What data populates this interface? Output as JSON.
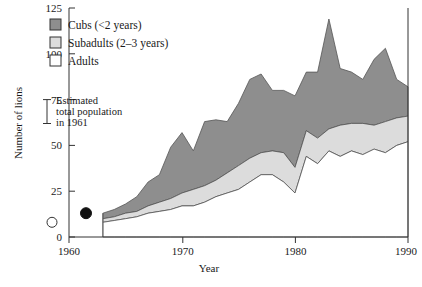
{
  "chart_data": {
    "type": "area",
    "stacked": true,
    "title": "",
    "xlabel": "Year",
    "ylabel": "Number of lions",
    "xlim": [
      1960,
      1990
    ],
    "ylim": [
      0,
      125
    ],
    "xticks": [
      1960,
      1970,
      1980,
      1990
    ],
    "yticks": [
      0,
      25,
      50,
      75,
      100,
      125
    ],
    "grid": false,
    "legend_position": "top-left",
    "x": [
      1963,
      1964,
      1965,
      1966,
      1967,
      1968,
      1969,
      1970,
      1971,
      1972,
      1973,
      1974,
      1975,
      1976,
      1977,
      1978,
      1979,
      1980,
      1981,
      1982,
      1983,
      1984,
      1985,
      1986,
      1987,
      1988,
      1989,
      1990
    ],
    "series": [
      {
        "name": "Adults",
        "color": "#ffffff",
        "values": [
          8,
          9,
          10,
          11,
          13,
          14,
          15,
          17,
          17,
          19,
          22,
          24,
          26,
          30,
          34,
          34,
          30,
          24,
          44,
          40,
          47,
          44,
          47,
          45,
          48,
          46,
          50,
          52
        ]
      },
      {
        "name": "Subadults (2–3 years)",
        "color": "#dcdcdc",
        "values": [
          2,
          2,
          3,
          3,
          4,
          5,
          6,
          7,
          9,
          9,
          9,
          11,
          13,
          13,
          12,
          13,
          16,
          14,
          14,
          14,
          12,
          17,
          15,
          17,
          13,
          17,
          15,
          14
        ]
      },
      {
        "name": "Cubs (<2 years)",
        "color": "#8e8e8e",
        "values": [
          3,
          4,
          5,
          8,
          13,
          15,
          28,
          33,
          21,
          35,
          33,
          28,
          34,
          43,
          43,
          33,
          34,
          39,
          32,
          36,
          60,
          31,
          28,
          24,
          36,
          40,
          21,
          16
        ]
      }
    ],
    "annotations": [
      {
        "name": "estimated-total-population-1961",
        "text_lines": [
          "Estimated",
          "total population",
          "in 1961"
        ],
        "marker": "error-bar",
        "value_range": [
          62,
          75
        ]
      },
      {
        "name": "open-circle-point",
        "marker": "open-circle",
        "x": 1958.5,
        "y": 8
      },
      {
        "name": "filled-circle-point",
        "marker": "filled-circle",
        "x": 1961.5,
        "y": 13
      }
    ]
  },
  "axes": {
    "ylabel": "Number of lions",
    "xlabel": "Year",
    "yticks": [
      "0",
      "25",
      "50",
      "75",
      "100",
      "125"
    ],
    "xticks": [
      "1960",
      "1970",
      "1980",
      "1990"
    ]
  },
  "legend": {
    "items": [
      {
        "label": "Cubs (<2 years)",
        "swatch": "#8e8e8e"
      },
      {
        "label": "Subadults (2–3 years)",
        "swatch": "#dcdcdc"
      },
      {
        "label": "Adults",
        "swatch": "#ffffff"
      }
    ]
  },
  "annotation": {
    "line1": "Estimated",
    "line2": "total population",
    "line3": "in 1961"
  },
  "caption": {
    "text": ""
  }
}
